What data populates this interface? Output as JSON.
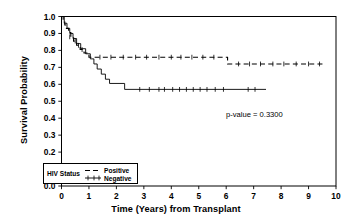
{
  "chart_data": {
    "type": "line",
    "title": "",
    "xlabel": "Time (Years) from Transplant",
    "ylabel": "Survival Probability",
    "xlim": [
      0,
      10
    ],
    "ylim": [
      0.0,
      1.0
    ],
    "xticks": [
      "0",
      "1",
      "2",
      "3",
      "4",
      "5",
      "6",
      "7",
      "8",
      "9",
      "10"
    ],
    "yticks": [
      "0.0",
      "0.1",
      "0.2",
      "0.3",
      "0.4",
      "0.5",
      "0.6",
      "0.7",
      "0.8",
      "0.9",
      "1.0"
    ],
    "grid": false,
    "legend": {
      "position": "lower-left",
      "title": "HIV Status",
      "entries": [
        {
          "label": "Positive",
          "style": "dashed"
        },
        {
          "label": "Negative",
          "style": "solid"
        }
      ]
    },
    "annotations": [
      {
        "text": "p-value = 0.3300",
        "x": 7.0,
        "y": 0.47
      }
    ],
    "series": [
      {
        "name": "Positive",
        "style": "dashed",
        "color": "#000000",
        "steps": [
          [
            0.0,
            1.0
          ],
          [
            0.06,
            0.975
          ],
          [
            0.12,
            0.95
          ],
          [
            0.18,
            0.93
          ],
          [
            0.26,
            0.905
          ],
          [
            0.34,
            0.88
          ],
          [
            0.44,
            0.855
          ],
          [
            0.55,
            0.83
          ],
          [
            0.68,
            0.805
          ],
          [
            0.82,
            0.785
          ],
          [
            1.0,
            0.76
          ],
          [
            6.05,
            0.72
          ],
          [
            9.55,
            0.72
          ]
        ],
        "censor_marks": [
          [
            0.3,
            0.88
          ],
          [
            0.5,
            0.855
          ],
          [
            0.62,
            0.83
          ],
          [
            0.75,
            0.805
          ],
          [
            1.4,
            0.76
          ],
          [
            1.8,
            0.76
          ],
          [
            2.25,
            0.76
          ],
          [
            2.7,
            0.76
          ],
          [
            3.1,
            0.76
          ],
          [
            3.55,
            0.76
          ],
          [
            4.0,
            0.76
          ],
          [
            4.35,
            0.76
          ],
          [
            4.75,
            0.76
          ],
          [
            5.15,
            0.76
          ],
          [
            5.55,
            0.76
          ],
          [
            6.45,
            0.72
          ],
          [
            6.85,
            0.72
          ],
          [
            7.25,
            0.72
          ],
          [
            7.7,
            0.72
          ],
          [
            8.1,
            0.72
          ],
          [
            8.55,
            0.72
          ],
          [
            9.0,
            0.72
          ],
          [
            9.4,
            0.72
          ]
        ]
      },
      {
        "name": "Negative",
        "style": "solid",
        "color": "#000000",
        "steps": [
          [
            0.0,
            1.0
          ],
          [
            0.1,
            0.96
          ],
          [
            0.2,
            0.93
          ],
          [
            0.3,
            0.9
          ],
          [
            0.42,
            0.87
          ],
          [
            0.55,
            0.84
          ],
          [
            0.7,
            0.81
          ],
          [
            0.88,
            0.78
          ],
          [
            1.05,
            0.75
          ],
          [
            1.18,
            0.72
          ],
          [
            1.3,
            0.69
          ],
          [
            1.45,
            0.66
          ],
          [
            1.6,
            0.63
          ],
          [
            1.75,
            0.605
          ],
          [
            2.3,
            0.57
          ],
          [
            7.45,
            0.57
          ]
        ],
        "censor_marks": [
          [
            2.85,
            0.57
          ],
          [
            3.2,
            0.57
          ],
          [
            3.55,
            0.57
          ],
          [
            3.75,
            0.57
          ],
          [
            4.05,
            0.57
          ],
          [
            4.3,
            0.57
          ],
          [
            4.55,
            0.57
          ],
          [
            4.8,
            0.57
          ],
          [
            5.05,
            0.57
          ],
          [
            5.3,
            0.57
          ],
          [
            5.6,
            0.57
          ],
          [
            5.9,
            0.57
          ],
          [
            6.8,
            0.57
          ],
          [
            7.05,
            0.57
          ]
        ]
      }
    ]
  },
  "axes": {
    "x_axis_label": "Time (Years) from Transplant",
    "y_axis_label": "Survival Probability"
  },
  "legend": {
    "title": "HIV Status",
    "positive_label": "Positive",
    "negative_label": "Negative"
  },
  "annotation": {
    "p_value_text": "p-value = 0.3300"
  },
  "colors": {
    "line": "#000000",
    "frame": "#000000",
    "background": "#ffffff"
  }
}
